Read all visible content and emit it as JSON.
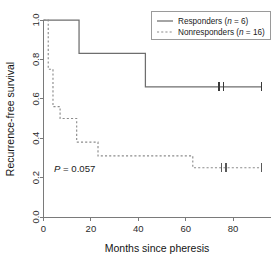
{
  "figure": {
    "background": "#ffffff",
    "width": 277,
    "height": 259
  },
  "annotations": {
    "pvalue_italic": "P",
    "pvalue_rest": " = 0.057"
  },
  "legend": {
    "entries": [
      {
        "label_main": "Responders (",
        "label_italic": "n",
        "label_tail": " = 6)",
        "style": "solid",
        "color": "#6e6e6e"
      },
      {
        "label_main": "Nonresponders (",
        "label_italic": "n",
        "label_tail": " = 16)",
        "style": "dashed",
        "color": "#8c8c8c"
      }
    ]
  },
  "chart_data": {
    "type": "line",
    "subtype": "kaplan-meier-step",
    "title": "",
    "xlabel": "Months since pheresis",
    "ylabel": "Recurrence-free survival",
    "xlim": [
      0,
      96
    ],
    "ylim": [
      0.0,
      1.0
    ],
    "xticks": [
      0,
      20,
      40,
      60,
      80
    ],
    "xticklabels": [
      "0",
      "20",
      "40",
      "60",
      "80"
    ],
    "yticks": [
      0.0,
      0.2,
      0.4,
      0.6,
      0.8,
      1.0
    ],
    "yticklabels": [
      "0.0",
      "0.2",
      "0.4",
      "0.6",
      "0.8",
      "1.0"
    ],
    "grid": false,
    "legend_position": "top-right",
    "annotation": "P = 0.057",
    "pvalue": 0.057,
    "series": [
      {
        "name": "Responders",
        "n": 6,
        "style": "solid",
        "color": "#6e6e6e",
        "steps": [
          {
            "x": 0,
            "y": 1.0
          },
          {
            "x": 15,
            "y": 1.0
          },
          {
            "x": 15,
            "y": 0.83
          },
          {
            "x": 43,
            "y": 0.83
          },
          {
            "x": 43,
            "y": 0.66
          },
          {
            "x": 92,
            "y": 0.66
          }
        ],
        "censored": [
          {
            "x": 74,
            "y": 0.66
          },
          {
            "x": 76,
            "y": 0.66
          },
          {
            "x": 92,
            "y": 0.66
          }
        ]
      },
      {
        "name": "Nonresponders",
        "n": 16,
        "style": "dashed",
        "color": "#8c8c8c",
        "steps": [
          {
            "x": 0,
            "y": 1.0
          },
          {
            "x": 2,
            "y": 1.0
          },
          {
            "x": 2,
            "y": 0.75
          },
          {
            "x": 4,
            "y": 0.75
          },
          {
            "x": 4,
            "y": 0.56
          },
          {
            "x": 7,
            "y": 0.56
          },
          {
            "x": 7,
            "y": 0.5
          },
          {
            "x": 14,
            "y": 0.5
          },
          {
            "x": 14,
            "y": 0.38
          },
          {
            "x": 23,
            "y": 0.38
          },
          {
            "x": 23,
            "y": 0.31
          },
          {
            "x": 63,
            "y": 0.31
          },
          {
            "x": 63,
            "y": 0.25
          },
          {
            "x": 92,
            "y": 0.25
          }
        ],
        "censored": [
          {
            "x": 75,
            "y": 0.25
          },
          {
            "x": 77,
            "y": 0.25
          },
          {
            "x": 92,
            "y": 0.25
          }
        ]
      }
    ]
  }
}
